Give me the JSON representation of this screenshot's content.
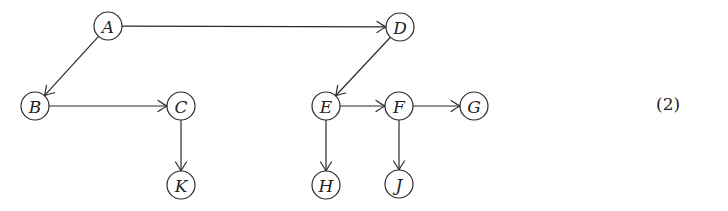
{
  "diagram": {
    "type": "directed-graph",
    "equation_number": "(2)",
    "node_radius": 14,
    "nodes": [
      {
        "id": "A",
        "label": "A",
        "x": 108,
        "y": 26
      },
      {
        "id": "B",
        "label": "B",
        "x": 35,
        "y": 106
      },
      {
        "id": "C",
        "label": "C",
        "x": 181,
        "y": 106
      },
      {
        "id": "K",
        "label": "K",
        "x": 181,
        "y": 185
      },
      {
        "id": "D",
        "label": "D",
        "x": 400,
        "y": 27
      },
      {
        "id": "E",
        "label": "E",
        "x": 326,
        "y": 106
      },
      {
        "id": "F",
        "label": "F",
        "x": 399,
        "y": 106
      },
      {
        "id": "G",
        "label": "G",
        "x": 474,
        "y": 106
      },
      {
        "id": "H",
        "label": "H",
        "x": 326,
        "y": 185
      },
      {
        "id": "J",
        "label": "J",
        "x": 399,
        "y": 184
      }
    ],
    "edges": [
      {
        "from": "A",
        "to": "D"
      },
      {
        "from": "A",
        "to": "B"
      },
      {
        "from": "B",
        "to": "C"
      },
      {
        "from": "C",
        "to": "K"
      },
      {
        "from": "D",
        "to": "E"
      },
      {
        "from": "E",
        "to": "F"
      },
      {
        "from": "F",
        "to": "G"
      },
      {
        "from": "E",
        "to": "H"
      },
      {
        "from": "F",
        "to": "J"
      }
    ],
    "colors": {
      "stroke": "#2a2a2a",
      "text": "#222222",
      "background": "#ffffff"
    }
  }
}
